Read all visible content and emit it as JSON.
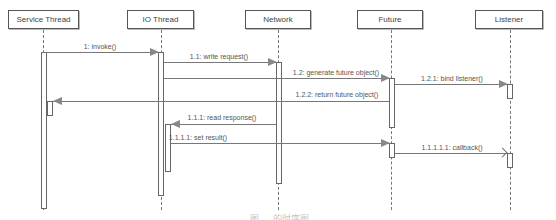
{
  "diagram": {
    "type": "UML sequence diagram",
    "actors": [
      {
        "id": "service",
        "label": "Service Thread"
      },
      {
        "id": "io",
        "label": "IO Thread"
      },
      {
        "id": "network",
        "label": "Network"
      },
      {
        "id": "future",
        "label": "Future"
      },
      {
        "id": "listener",
        "label": "Listener"
      }
    ],
    "messages": [
      {
        "label": "1: invoke()",
        "from": "Service Thread",
        "to": "IO Thread"
      },
      {
        "label": "1.1: write request()",
        "from": "IO Thread",
        "to": "Network"
      },
      {
        "label": "1.2: generate future object()",
        "from": "IO Thread",
        "to": "Future"
      },
      {
        "label": "1.2.1: bind listener()",
        "from": "Future",
        "to": "Listener"
      },
      {
        "label": "1.2.2: return future object()",
        "from": "Future",
        "to": "Service Thread"
      },
      {
        "label": "1.1.1: read response()",
        "from": "Network",
        "to": "IO Thread"
      },
      {
        "label": "1.1.1.1: set result()",
        "from": "IO Thread",
        "to": "Future"
      },
      {
        "label": "1.1.1.1.1: callback()",
        "from": "Future",
        "to": "Listener"
      }
    ],
    "caption": "图 … 的时序图"
  }
}
